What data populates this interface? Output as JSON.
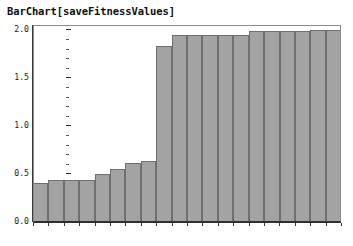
{
  "chart_data": {
    "type": "bar",
    "title": "BarChart[saveFitnessValues]",
    "xlabel": "",
    "ylabel": "",
    "ylim": [
      0.0,
      2.05
    ],
    "ytick_labels": [
      "0.0",
      "0.5",
      "1.0",
      "1.5",
      "2.0"
    ],
    "ytick_values": [
      0.0,
      0.5,
      1.0,
      1.5,
      2.0
    ],
    "minor_ticks_per_interval": 4,
    "grid": false,
    "legend": null,
    "xtick_labels": [],
    "categories": [
      1,
      2,
      3,
      4,
      5,
      6,
      7,
      8,
      9,
      10,
      11,
      12,
      13,
      14,
      15,
      16,
      17,
      18,
      19,
      20
    ],
    "values": [
      0.41,
      0.44,
      0.44,
      0.44,
      0.5,
      0.55,
      0.61,
      0.64,
      1.83,
      1.95,
      1.95,
      1.95,
      1.95,
      1.95,
      1.99,
      1.99,
      1.99,
      1.99,
      2.0,
      2.0
    ],
    "bar_fill_color": "#a3a3a3",
    "bar_border_color": "#6f6f6f",
    "axis_color": "#303030",
    "frame_color": "#8c8c8c",
    "background_color": "#ffffff"
  }
}
